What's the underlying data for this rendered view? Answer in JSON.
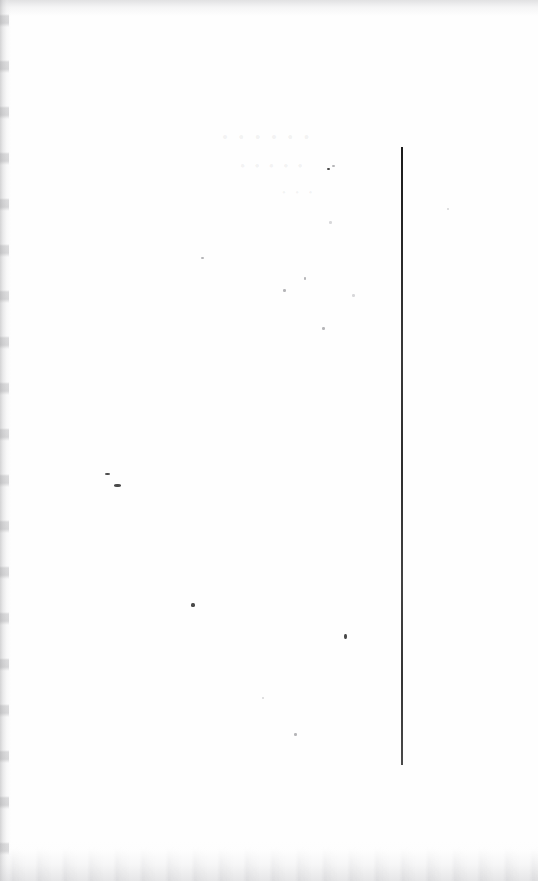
{
  "document": {
    "kind": "scanned-page",
    "page_type": "blank-verso",
    "width": 538,
    "height": 881,
    "background_color": "#ffffff",
    "paper_tone": "#fefefe",
    "visible_text": "",
    "notes_visible_on_page": "none"
  },
  "marks": {
    "vertical_rule": {
      "name": "vertical-rule",
      "color": "#2a2a2a",
      "x": 401,
      "y_top": 147,
      "y_bottom": 765,
      "length": 618,
      "thickness": 2
    },
    "edge_shadows": [
      {
        "name": "left-gutter-shadow",
        "edge": "left",
        "color": "#b0b0b2",
        "extent": 11
      },
      {
        "name": "top-edge-shadow",
        "edge": "top",
        "color": "#c4c4c7",
        "extent": 16
      },
      {
        "name": "bottom-edge-shadow",
        "edge": "bottom",
        "color": "#c9c9cc",
        "extent": 42
      }
    ],
    "specks": [
      {
        "x": 105,
        "y": 473,
        "w": 5,
        "h": 2,
        "tone": "dark"
      },
      {
        "x": 114,
        "y": 484,
        "w": 7,
        "h": 3,
        "tone": "dark"
      },
      {
        "x": 201,
        "y": 257,
        "w": 3,
        "h": 2,
        "tone": "faint"
      },
      {
        "x": 283,
        "y": 289,
        "w": 3,
        "h": 3,
        "tone": "faint"
      },
      {
        "x": 304,
        "y": 277,
        "w": 2,
        "h": 3,
        "tone": "faint"
      },
      {
        "x": 352,
        "y": 294,
        "w": 3,
        "h": 3,
        "tone": "pale"
      },
      {
        "x": 322,
        "y": 327,
        "w": 3,
        "h": 3,
        "tone": "faint"
      },
      {
        "x": 327,
        "y": 168,
        "w": 3,
        "h": 2,
        "tone": "dark"
      },
      {
        "x": 332,
        "y": 165,
        "w": 3,
        "h": 2,
        "tone": "faint"
      },
      {
        "x": 329,
        "y": 221,
        "w": 3,
        "h": 3,
        "tone": "pale"
      },
      {
        "x": 191,
        "y": 603,
        "w": 4,
        "h": 4,
        "tone": "dark"
      },
      {
        "x": 344,
        "y": 634,
        "w": 3,
        "h": 5,
        "tone": "dark"
      },
      {
        "x": 294,
        "y": 733,
        "w": 3,
        "h": 3,
        "tone": "faint"
      },
      {
        "x": 262,
        "y": 697,
        "w": 2,
        "h": 2,
        "tone": "pale"
      },
      {
        "x": 447,
        "y": 208,
        "w": 2,
        "h": 2,
        "tone": "pale"
      }
    ],
    "show_through": {
      "description": "illegible ink bleed-through from the reverse side",
      "line_1": "• • • • • •",
      "line_2": "• • • • •",
      "line_3": "• • •"
    }
  }
}
